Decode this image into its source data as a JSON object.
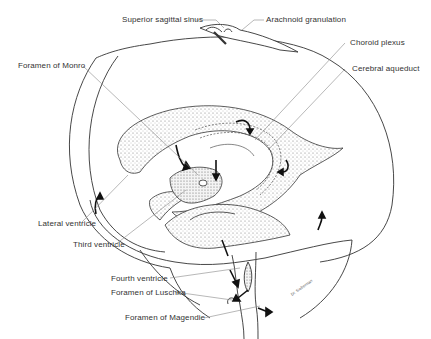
{
  "diagram": {
    "labels": {
      "superior_sagittal_sinus": "Superior sagittal sinus",
      "arachnoid_granulation": "Arachnoid granulation",
      "choroid_plexus": "Choroid plexus",
      "cerebral_aqueduct": "Cerebral aqueduct",
      "foramen_of_monro": "Foramen of Monro",
      "lateral_ventricle": "Lateral  ventricle",
      "third_ventricle": "Third ventricle",
      "fourth_ventricle": "Fourth ventricle",
      "foramen_of_luschka": "Foramen of Luschka",
      "foramen_of_magendie": "Foramen of Magendie"
    },
    "colors": {
      "line": "#333333",
      "leader": "#888888",
      "stipple": "#9a9a9a",
      "background": "#ffffff"
    }
  }
}
